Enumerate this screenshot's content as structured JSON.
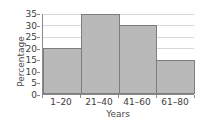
{
  "chart_data": {
    "type": "bar",
    "title": "",
    "subtitle": "",
    "xlabel": "Years",
    "ylabel": "Percentage",
    "categories": [
      "1–20",
      "21–40",
      "41–60",
      "61–80"
    ],
    "values": [
      20,
      35,
      30,
      15
    ],
    "series": [
      {
        "name": "Percentage",
        "values": [
          20,
          35,
          30,
          15
        ]
      }
    ],
    "ylim": [
      0,
      35
    ],
    "xlim": [
      0,
      4
    ],
    "ytick_labels": [
      "0",
      "5",
      "10",
      "15",
      "20",
      "25",
      "30",
      "35"
    ],
    "ytick_values": [
      0,
      5,
      10,
      15,
      20,
      25,
      30,
      35
    ],
    "xtick_labels": [
      "1–20",
      "21–40",
      "41–60",
      "61–80"
    ],
    "grid": true,
    "grid_axis": "y",
    "legend": false,
    "legend_position": "none",
    "annotations": [],
    "colors": {
      "bar_fill": "#b9b9b9",
      "bar_edge": "#7d7d7d",
      "gridline": "#d8d8d8",
      "axis": "#8a8a8a",
      "tick_text": "#3c3c3c",
      "axis_label_text": "#4a4a4a",
      "background": "#ffffff"
    }
  }
}
